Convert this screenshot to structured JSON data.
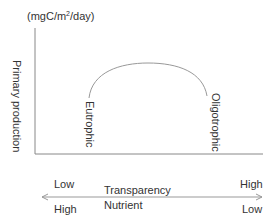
{
  "diagram": {
    "unit_label_prefix": "(mgC/m",
    "unit_label_sup": "2",
    "unit_label_suffix": "/day)",
    "y_axis_label": "Primary production",
    "curve_labels": {
      "left": "Eutrophic",
      "right": "Oligotrophic"
    },
    "bottom_axis": {
      "transparency": {
        "label": "Transparency",
        "left": "Low",
        "right": "High"
      },
      "nutrient": {
        "label": "Nutrient",
        "left": "High",
        "right": "Low"
      }
    },
    "colors": {
      "text": "#333333",
      "axis": "#888888",
      "curve": "#999999"
    }
  }
}
